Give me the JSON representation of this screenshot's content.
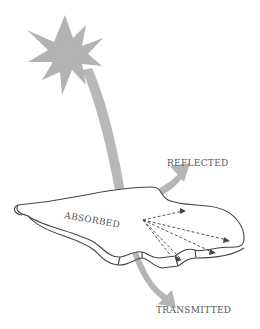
{
  "diagram": {
    "type": "light-leaf-interaction",
    "labels": {
      "reflected": "REFLECTED",
      "absorbed": "ABSORBED",
      "transmitted": "TRANSMITTED"
    },
    "elements": {
      "sun": "sun-icon",
      "incoming_ray": "sunlight-beam",
      "leaf": "leaf",
      "reflected_ray": "reflected-arrow",
      "transmitted_ray": "transmitted-arrow",
      "internal_paths": "scattered-light-arrows"
    },
    "colors": {
      "ray": "#b5b5b5",
      "sun": "#b3b3b3",
      "outline": "#444444",
      "text": "#555555"
    }
  }
}
